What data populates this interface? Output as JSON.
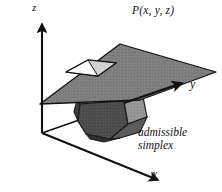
{
  "figure": {
    "background_color": "#ffffff",
    "line_color": "#111111",
    "axes": {
      "origin_label": "",
      "z_label": "z",
      "y_label": "y",
      "x_label": "x",
      "z_axis_name": "vertical-axis",
      "y_axis_name": "depth-axis",
      "x_axis_name": "horizontal-axis"
    },
    "labels": {
      "plane": "P(x, y, z)",
      "simplex_line1": "admissible",
      "simplex_line2": "simplex"
    },
    "colors": {
      "plane_fill": "#7d7d7d",
      "plane_edge": "#111111",
      "hole_fill_light": "#f2f2f2",
      "hole_fill_white": "#ffffff",
      "hole_fill_mid": "#c9c9c9",
      "poly_face_front_dark": "#4c4c4c",
      "poly_face_left_dark": "#434343",
      "poly_face_right_mid": "#8f8f8f",
      "poly_face_right_light": "#9c9c9c",
      "poly_face_top_white": "#f4f4f4",
      "poly_face_top_shadow": "#dcdcdc",
      "poly_edge": "#1a1a1a",
      "text_color": "#111111"
    },
    "geometry": {
      "plane_quad": "40,104 120,44 216,72 140,100",
      "hole_quad": "66,72 88,60 116,63 98,76",
      "axis_z_start": "42,133",
      "axis_z_end": "42,22",
      "axis_y_start": "120,100",
      "axis_y_end": "184,82",
      "axis_x_start": "42,133",
      "axis_x_end": "162,182",
      "poly_outline": "78,96 95,88 126,88 142,98 146,118 130,135 104,140 82,130 74,112"
    },
    "stats": {
      "width_px": 222,
      "height_px": 192
    }
  }
}
